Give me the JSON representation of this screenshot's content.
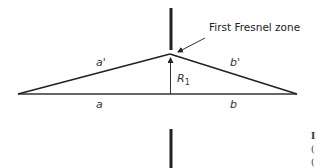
{
  "diagram": {
    "title_callout": "First Fresnel zone",
    "labels": {
      "a_prime": "a'",
      "b_prime": "b'",
      "a": "a",
      "b": "b",
      "r1": "R",
      "r1_sub": "1"
    },
    "edge_fragments": [
      "I",
      "(",
      "("
    ],
    "colors": {
      "line": "#222222",
      "text": "#333333",
      "background": "#ffffff"
    }
  }
}
